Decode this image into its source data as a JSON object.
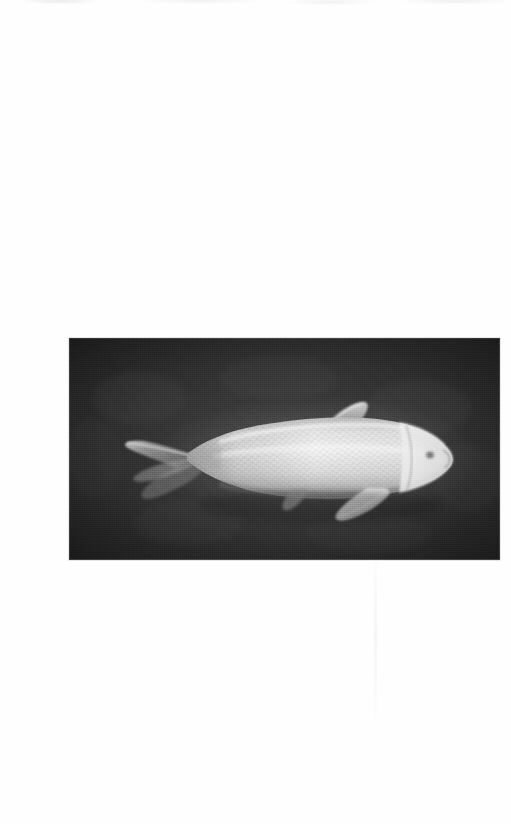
{
  "page": {
    "kind": "scanned-book-page",
    "background_color": "#fefefe",
    "width_px": 511,
    "height_px": 824,
    "header_text": "",
    "footer_text": "",
    "caption_text": "",
    "page_number": ""
  },
  "figure": {
    "name": "koi-carp-photograph",
    "alt_text": "Black and white photograph of a pale platinum koi carp swimming, viewed from the side, head toward the right, against a dark water background",
    "frame": {
      "x_px": 29,
      "y_px": 322,
      "width_px": 431,
      "height_px": 222
    },
    "print_style": "halftone-grayscale",
    "colors": {
      "photo_background": "#323232",
      "photo_background_dark": "#262626",
      "fish_body_highlight": "#f2f2f2",
      "fish_body_midtone": "#cfcfcf",
      "fish_body_shadow": "#9a9a9a",
      "fin_translucent": "#8d8d8d",
      "frame_edge": "#787878"
    },
    "subject": {
      "common_name": "Koi carp",
      "orientation": "facing-right",
      "parts": [
        "caudal-fin",
        "body",
        "dorsal-fin",
        "pectoral-fin",
        "pelvic-fin",
        "head",
        "eye",
        "mouth",
        "scales"
      ]
    }
  }
}
